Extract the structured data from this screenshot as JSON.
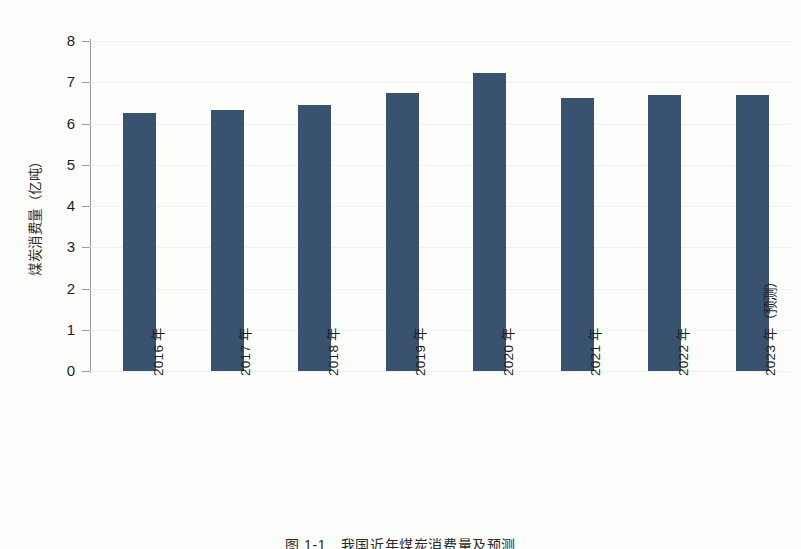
{
  "chart_data": {
    "type": "bar",
    "title": "",
    "xlabel": "",
    "ylabel": "煤炭消费量（亿吨）",
    "ylim": [
      0,
      8
    ],
    "ytick_labels": [
      "8",
      "7",
      "6",
      "5",
      "4",
      "3",
      "2",
      "1",
      "0"
    ],
    "yticks": [
      8,
      7,
      6,
      5,
      4,
      3,
      2,
      1,
      0
    ],
    "grid": false,
    "legend": null,
    "bar_color": "#39526f",
    "categories": [
      "2016 年",
      "2017 年",
      "2018 年",
      "2019 年",
      "2020 年",
      "2021 年",
      "2022 年",
      "2023 年（预测）"
    ],
    "values": [
      6.25,
      6.32,
      6.46,
      6.73,
      7.23,
      6.62,
      6.68,
      6.7
    ],
    "series": [
      {
        "name": "煤炭消费量",
        "values": [
          6.25,
          6.32,
          6.46,
          6.73,
          7.23,
          6.62,
          6.68,
          6.7
        ]
      }
    ]
  },
  "figure": {
    "caption": "图 1-1　我国近年煤炭消费量及预测"
  }
}
